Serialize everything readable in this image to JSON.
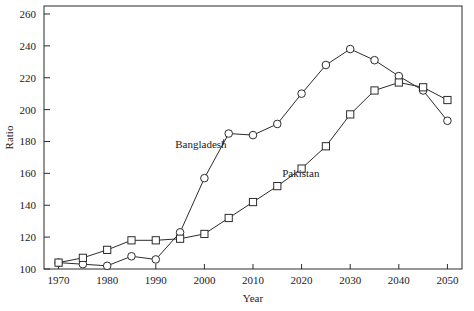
{
  "chart_data": {
    "type": "line",
    "title": "",
    "xlabel": "Year",
    "ylabel": "Ratio",
    "x": [
      1970,
      1975,
      1980,
      1985,
      1990,
      1995,
      2000,
      2005,
      2010,
      2015,
      2020,
      2025,
      2030,
      2035,
      2040,
      2045,
      2050
    ],
    "xlim": [
      1967,
      2053
    ],
    "ylim": [
      100,
      265
    ],
    "xticks": [
      1970,
      1980,
      1990,
      2000,
      2010,
      2020,
      2030,
      2040,
      2050
    ],
    "xtick_labels": [
      "1970",
      "1980",
      "1990",
      "2000",
      "2010",
      "2020",
      "2030",
      "2040",
      "2050"
    ],
    "yticks": [
      100,
      120,
      140,
      160,
      180,
      200,
      220,
      240,
      260
    ],
    "ytick_labels": [
      "100",
      "120",
      "140",
      "160",
      "180",
      "200",
      "220",
      "240",
      "260"
    ],
    "grid": false,
    "legend_position": "inline-annotation",
    "series": [
      {
        "name": "Bangladesh",
        "marker": "circle",
        "color": "#2b2b2b",
        "values": [
          104,
          103,
          102,
          108,
          106,
          123,
          157,
          185,
          184,
          191,
          210,
          228,
          238,
          231,
          221,
          212,
          193
        ]
      },
      {
        "name": "Pakistan",
        "marker": "square",
        "color": "#2b2b2b",
        "values": [
          104,
          107,
          112,
          118,
          118,
          119,
          122,
          132,
          142,
          152,
          163,
          177,
          197,
          212,
          217,
          214,
          206
        ]
      }
    ],
    "annotations": [
      {
        "text": "Bangladesh",
        "x": 1994,
        "y": 176,
        "leader_to_x": 2004,
        "leader_to_y": 184
      },
      {
        "text": "Pakistan",
        "x": 2016,
        "y": 158,
        "leader_to_x": 2016,
        "leader_to_y": 158
      }
    ]
  }
}
